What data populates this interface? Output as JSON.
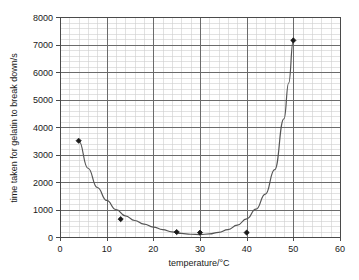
{
  "chart_data": {
    "type": "scatter",
    "title": "",
    "subtitle": "",
    "xlabel": "temperature/°C",
    "ylabel": "time taken for gelatin to break down/s",
    "xlim": [
      0,
      60
    ],
    "ylim": [
      0,
      8000
    ],
    "x_major_step": 10,
    "y_major_step": 1000,
    "x_minor_divisions": 5,
    "y_minor_divisions": 5,
    "grid": true,
    "legend": false,
    "legend_position": "none",
    "xticks": [
      "0",
      "10",
      "20",
      "30",
      "40",
      "50",
      "60"
    ],
    "xtick_values": [
      0,
      10,
      20,
      30,
      40,
      50,
      60
    ],
    "yticks": [
      "0",
      "1000",
      "2000",
      "3000",
      "4000",
      "5000",
      "6000",
      "7000",
      "8000"
    ],
    "ytick_values": [
      0,
      1000,
      2000,
      3000,
      4000,
      5000,
      6000,
      7000,
      8000
    ],
    "series": [
      {
        "name": "measured points",
        "marker": "diamond",
        "x": [
          4,
          13,
          25,
          30,
          40,
          50
        ],
        "y": [
          3500,
          650,
          180,
          160,
          160,
          7150
        ]
      },
      {
        "name": "fitted curve",
        "marker": "none",
        "line": true,
        "x": [
          4,
          6,
          8,
          10,
          12,
          14,
          16,
          18,
          20,
          22,
          24,
          26,
          28,
          30,
          32,
          34,
          36,
          38,
          40,
          42,
          44,
          46,
          48,
          49,
          50
        ],
        "y": [
          3500,
          2500,
          1800,
          1330,
          1000,
          770,
          600,
          470,
          360,
          270,
          190,
          130,
          100,
          90,
          110,
          170,
          270,
          430,
          660,
          1010,
          1560,
          2450,
          4300,
          5600,
          7150
        ]
      }
    ],
    "colors": {
      "marker": "#1a1a1a",
      "curve": "#555555",
      "major_grid": "#6b6b6b",
      "minor_grid": "#cfcfcf",
      "axis": "#4a4a4a",
      "text": "#1a1a1a",
      "background": "#ffffff"
    }
  }
}
